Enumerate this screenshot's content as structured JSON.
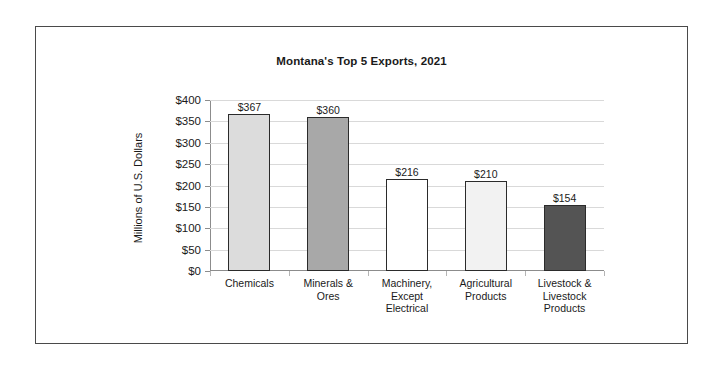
{
  "figure": {
    "border_color": "#4a4a4a",
    "background": "#ffffff"
  },
  "chart_data": {
    "type": "bar",
    "title": "Montana's Top 5 Exports, 2021",
    "xlabel": "",
    "ylabel": "Millions of U.S. Dollars",
    "ylim": [
      0,
      400
    ],
    "ytick_step": 50,
    "grid": true,
    "legend": false,
    "value_prefix": "$",
    "categories": [
      "Chemicals",
      "Minerals &\nOres",
      "Machinery,\nExcept\nElectrical",
      "Agricultural\nProducts",
      "Livestock &\nLivestock\nProducts"
    ],
    "values": [
      367,
      360,
      216,
      210,
      154
    ],
    "value_labels": [
      "$367",
      "$360",
      "$216",
      "$210",
      "$154"
    ],
    "bar_colors": [
      "#dcdcdc",
      "#a8a8a8",
      "#ffffff",
      "#f2f2f2",
      "#545454"
    ],
    "bar_edge_color": "#2b2b2b",
    "ytick_labels": [
      "$400",
      "$350",
      "$300",
      "$250",
      "$200",
      "$150",
      "$100",
      "$50",
      "$0"
    ],
    "ytick_values": [
      400,
      350,
      300,
      250,
      200,
      150,
      100,
      50,
      0
    ],
    "gridline_color": "#d9d9d9",
    "axis_color": "#8c8c8c"
  }
}
